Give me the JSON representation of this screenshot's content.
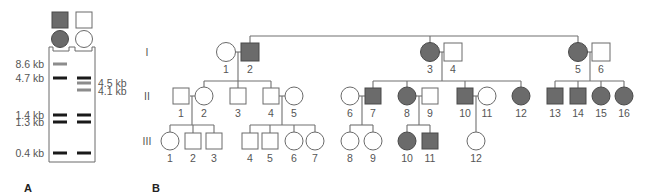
{
  "colors": {
    "affected_fill": "#6b6b6b",
    "unaffected_fill": "#ffffff",
    "line": "#707070",
    "band_black": "#1a1a1a",
    "band_gray": "#8c8c8c",
    "text": "#555555"
  },
  "panel_a": {
    "label": "A",
    "lanes": [
      {
        "id": "affected",
        "shape": "square",
        "affected": true
      },
      {
        "id": "unaffected",
        "shape": "square",
        "affected": false
      }
    ],
    "lane_circles": [
      {
        "id": "affected",
        "affected": true
      },
      {
        "id": "unaffected",
        "affected": false
      }
    ],
    "left_markers": [
      {
        "label": "8.6 kb",
        "y": 64
      },
      {
        "label": "4.7 kb",
        "y": 78
      },
      {
        "label": "1.4 kb",
        "y": 115
      },
      {
        "label": "1.3 kb",
        "y": 122
      },
      {
        "label": "0.4 kb",
        "y": 153
      }
    ],
    "right_markers": [
      {
        "label": "4.5 kb",
        "y": 83
      },
      {
        "label": "4.1 kb",
        "y": 91
      }
    ],
    "bands": [
      {
        "lane": 0,
        "size": "8.6 kb",
        "y": 64,
        "tone": "gray"
      },
      {
        "lane": 0,
        "size": "4.7 kb",
        "y": 78,
        "tone": "black"
      },
      {
        "lane": 0,
        "size": "1.4 kb",
        "y": 115,
        "tone": "black"
      },
      {
        "lane": 0,
        "size": "1.3 kb",
        "y": 122,
        "tone": "black"
      },
      {
        "lane": 0,
        "size": "0.4 kb",
        "y": 153,
        "tone": "black"
      },
      {
        "lane": 1,
        "size": "4.7 kb",
        "y": 78,
        "tone": "black"
      },
      {
        "lane": 1,
        "size": "4.5 kb",
        "y": 83,
        "tone": "gray"
      },
      {
        "lane": 1,
        "size": "4.1 kb",
        "y": 90,
        "tone": "gray"
      },
      {
        "lane": 1,
        "size": "1.4 kb",
        "y": 115,
        "tone": "black"
      },
      {
        "lane": 1,
        "size": "1.3 kb",
        "y": 122,
        "tone": "black"
      },
      {
        "lane": 1,
        "size": "0.4 kb",
        "y": 153,
        "tone": "black"
      }
    ]
  },
  "panel_b": {
    "label": "B",
    "generations": [
      {
        "label": "I",
        "y": 52
      },
      {
        "label": "II",
        "y": 96
      },
      {
        "label": "III",
        "y": 141
      }
    ],
    "individuals": [
      {
        "gen": "I",
        "num": "1",
        "shape": "circle",
        "affected": false,
        "x": 226
      },
      {
        "gen": "I",
        "num": "2",
        "shape": "square",
        "affected": true,
        "x": 250
      },
      {
        "gen": "I",
        "num": "3",
        "shape": "circle",
        "affected": true,
        "x": 430
      },
      {
        "gen": "I",
        "num": "4",
        "shape": "square",
        "affected": false,
        "x": 453
      },
      {
        "gen": "I",
        "num": "5",
        "shape": "circle",
        "affected": true,
        "x": 578
      },
      {
        "gen": "I",
        "num": "6",
        "shape": "square",
        "affected": false,
        "x": 601
      },
      {
        "gen": "II",
        "num": "1",
        "shape": "square",
        "affected": false,
        "x": 181
      },
      {
        "gen": "II",
        "num": "2",
        "shape": "circle",
        "affected": false,
        "x": 204
      },
      {
        "gen": "II",
        "num": "3",
        "shape": "square",
        "affected": false,
        "x": 238
      },
      {
        "gen": "II",
        "num": "4",
        "shape": "square",
        "affected": false,
        "x": 271
      },
      {
        "gen": "II",
        "num": "5",
        "shape": "circle",
        "affected": false,
        "x": 294
      },
      {
        "gen": "II",
        "num": "6",
        "shape": "circle",
        "affected": false,
        "x": 350
      },
      {
        "gen": "II",
        "num": "7",
        "shape": "square",
        "affected": true,
        "x": 373
      },
      {
        "gen": "II",
        "num": "8",
        "shape": "circle",
        "affected": true,
        "x": 407
      },
      {
        "gen": "II",
        "num": "9",
        "shape": "square",
        "affected": false,
        "x": 430
      },
      {
        "gen": "II",
        "num": "10",
        "shape": "square",
        "affected": true,
        "x": 465
      },
      {
        "gen": "II",
        "num": "11",
        "shape": "circle",
        "affected": false,
        "x": 487
      },
      {
        "gen": "II",
        "num": "12",
        "shape": "circle",
        "affected": true,
        "x": 521
      },
      {
        "gen": "II",
        "num": "13",
        "shape": "square",
        "affected": true,
        "x": 555
      },
      {
        "gen": "II",
        "num": "14",
        "shape": "square",
        "affected": true,
        "x": 578
      },
      {
        "gen": "II",
        "num": "15",
        "shape": "circle",
        "affected": true,
        "x": 601
      },
      {
        "gen": "II",
        "num": "16",
        "shape": "circle",
        "affected": true,
        "x": 624
      },
      {
        "gen": "III",
        "num": "1",
        "shape": "circle",
        "affected": false,
        "x": 170
      },
      {
        "gen": "III",
        "num": "2",
        "shape": "square",
        "affected": false,
        "x": 193
      },
      {
        "gen": "III",
        "num": "3",
        "shape": "square",
        "affected": false,
        "x": 214
      },
      {
        "gen": "III",
        "num": "4",
        "shape": "square",
        "affected": false,
        "x": 250
      },
      {
        "gen": "III",
        "num": "5",
        "shape": "square",
        "affected": false,
        "x": 270
      },
      {
        "gen": "III",
        "num": "6",
        "shape": "circle",
        "affected": false,
        "x": 294
      },
      {
        "gen": "III",
        "num": "7",
        "shape": "circle",
        "affected": false,
        "x": 315
      },
      {
        "gen": "III",
        "num": "8",
        "shape": "circle",
        "affected": false,
        "x": 350
      },
      {
        "gen": "III",
        "num": "9",
        "shape": "circle",
        "affected": false,
        "x": 373
      },
      {
        "gen": "III",
        "num": "10",
        "shape": "circle",
        "affected": true,
        "x": 407
      },
      {
        "gen": "III",
        "num": "11",
        "shape": "square",
        "affected": true,
        "x": 430
      },
      {
        "gen": "III",
        "num": "12",
        "shape": "circle",
        "affected": false,
        "x": 476
      }
    ],
    "lines": [
      [
        250,
        36,
        578,
        36
      ],
      [
        250,
        36,
        250,
        43
      ],
      [
        430,
        36,
        430,
        43
      ],
      [
        578,
        36,
        578,
        43
      ],
      [
        235,
        52,
        241,
        52
      ],
      [
        238,
        52,
        238,
        81
      ],
      [
        204,
        81,
        271,
        81
      ],
      [
        204,
        81,
        204,
        87
      ],
      [
        238,
        81,
        238,
        88
      ],
      [
        271,
        81,
        271,
        88
      ],
      [
        190,
        96,
        195,
        96
      ],
      [
        192,
        96,
        192,
        125
      ],
      [
        170,
        125,
        214,
        125
      ],
      [
        170,
        125,
        170,
        132
      ],
      [
        193,
        125,
        193,
        133
      ],
      [
        214,
        125,
        214,
        133
      ],
      [
        279,
        96,
        285,
        96
      ],
      [
        282,
        96,
        282,
        125
      ],
      [
        250,
        125,
        315,
        125
      ],
      [
        250,
        125,
        250,
        133
      ],
      [
        270,
        125,
        270,
        133
      ],
      [
        294,
        125,
        294,
        132
      ],
      [
        315,
        125,
        315,
        132
      ],
      [
        439,
        52,
        445,
        52
      ],
      [
        442,
        52,
        442,
        81
      ],
      [
        373,
        81,
        521,
        81
      ],
      [
        373,
        81,
        373,
        88
      ],
      [
        407,
        81,
        407,
        87
      ],
      [
        465,
        81,
        465,
        88
      ],
      [
        521,
        81,
        521,
        87
      ],
      [
        359,
        96,
        365,
        96
      ],
      [
        362,
        96,
        362,
        125
      ],
      [
        350,
        125,
        373,
        125
      ],
      [
        350,
        125,
        350,
        132
      ],
      [
        373,
        125,
        373,
        132
      ],
      [
        416,
        96,
        422,
        96
      ],
      [
        419,
        96,
        419,
        125
      ],
      [
        407,
        125,
        430,
        125
      ],
      [
        407,
        125,
        407,
        132
      ],
      [
        430,
        125,
        430,
        133
      ],
      [
        473,
        96,
        478,
        96
      ],
      [
        476,
        96,
        476,
        132
      ],
      [
        587,
        52,
        593,
        52
      ],
      [
        590,
        52,
        590,
        81
      ],
      [
        555,
        81,
        624,
        81
      ],
      [
        555,
        81,
        555,
        88
      ],
      [
        578,
        81,
        578,
        88
      ],
      [
        601,
        81,
        601,
        87
      ],
      [
        624,
        81,
        624,
        87
      ]
    ]
  }
}
